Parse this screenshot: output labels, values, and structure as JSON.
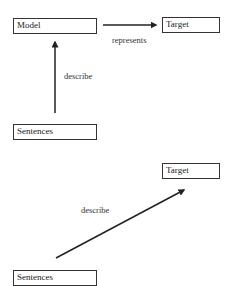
{
  "diagram_top": {
    "nodes": {
      "model": "Model",
      "target": "Target",
      "sentences": "Sentences"
    },
    "edges": {
      "model_to_target": "represents",
      "sentences_to_model": "describe"
    }
  },
  "diagram_bottom": {
    "nodes": {
      "target": "Target",
      "sentences": "Sentences"
    },
    "edges": {
      "sentences_to_target": "describe"
    }
  },
  "colors": {
    "stroke": "#222222",
    "background": "#ffffff"
  }
}
